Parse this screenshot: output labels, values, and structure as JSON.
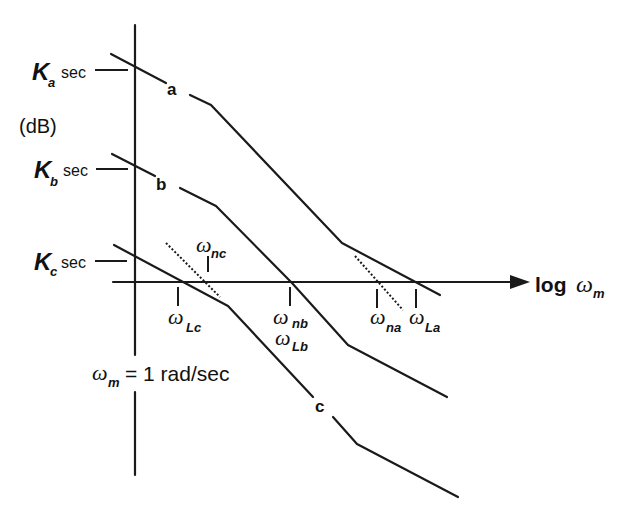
{
  "diagram": {
    "type": "bode-magnitude-asymptotic",
    "y_axis_label": "(dB)",
    "x_axis_label": {
      "main": "log",
      "omega": "ω",
      "sub": "m"
    },
    "vertical_axis_annotation": {
      "omega": "ω",
      "sub": "m",
      "text": "= 1 rad/sec"
    },
    "gain_labels": [
      {
        "id": "Ka",
        "K": "K",
        "sub": "a",
        "unit": "sec"
      },
      {
        "id": "Kb",
        "K": "K",
        "sub": "b",
        "unit": "sec"
      },
      {
        "id": "Kc",
        "K": "K",
        "sub": "c",
        "unit": "sec"
      }
    ],
    "curves": [
      {
        "id": "a",
        "label": "a"
      },
      {
        "id": "b",
        "label": "b"
      },
      {
        "id": "c",
        "label": "c"
      }
    ],
    "frequency_marks": [
      {
        "id": "Lc",
        "omega": "ω",
        "sub": "Lc"
      },
      {
        "id": "nc",
        "omega": "ω",
        "sub": "nc"
      },
      {
        "id": "nb",
        "omega": "ω",
        "sub": "nb"
      },
      {
        "id": "Lb",
        "omega": "ω",
        "sub": "Lb"
      },
      {
        "id": "na",
        "omega": "ω",
        "sub": "na"
      },
      {
        "id": "La",
        "omega": "ω",
        "sub": "La"
      }
    ]
  }
}
